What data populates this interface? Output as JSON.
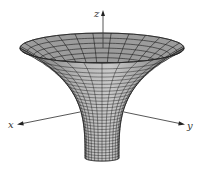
{
  "figure": {
    "background": "#ffffff",
    "surface_color": "#8a8a8a",
    "surface_light": "#b4b4b4",
    "inner_color": "#9c9c9c",
    "mesh_color": "#1a1a1a",
    "axis_color": "#444444"
  },
  "axes": {
    "x": {
      "label": "x"
    },
    "y": {
      "label": "y"
    },
    "z": {
      "label": "z"
    }
  },
  "surface": {
    "center_x": 102,
    "rim_y": 48,
    "rim_rx": 82,
    "rim_ry": 15,
    "neck_rx": 17,
    "bottom_y": 158,
    "bottom_ry": 3.5,
    "meridians": 28,
    "parallels": 30
  }
}
